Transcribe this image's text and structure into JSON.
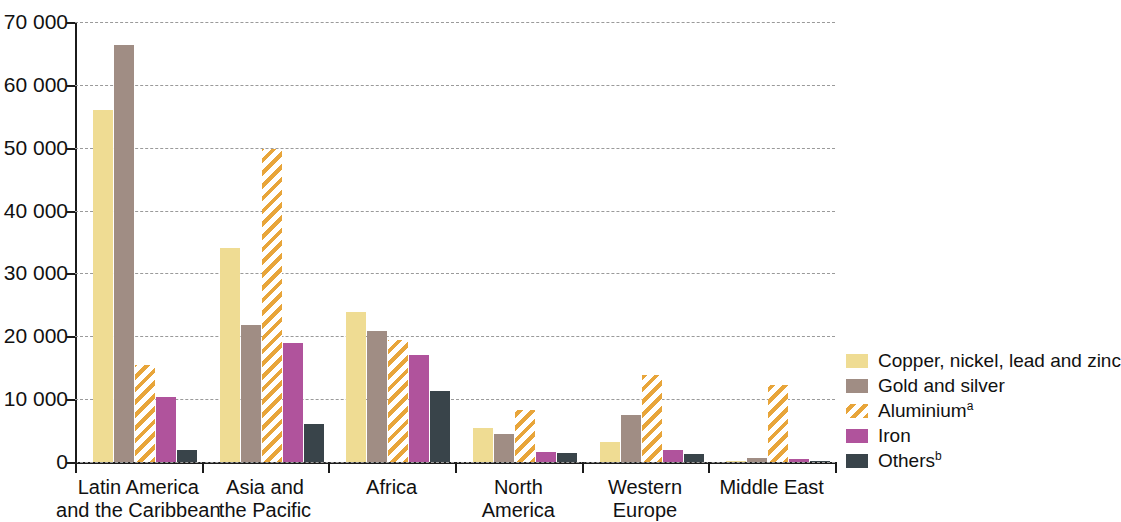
{
  "chart_data": {
    "type": "bar",
    "title": "",
    "subtitle": "",
    "xlabel": "",
    "ylabel": "",
    "ylim": [
      0,
      70000
    ],
    "ytick_labels": [
      "0",
      "10 000",
      "20 000",
      "30 000",
      "40 000",
      "50 000",
      "60 000",
      "70 000"
    ],
    "ytick_values": [
      0,
      10000,
      20000,
      30000,
      40000,
      50000,
      60000,
      70000
    ],
    "grid": true,
    "grid_style": "dashed-horizontal",
    "legend_position": "right",
    "categories": [
      "Latin America\nand the Caribbean",
      "Asia and\nthe Pacific",
      "Africa",
      "North\nAmerica",
      "Western\nEurope",
      "Middle East"
    ],
    "series": [
      {
        "name": "Copper, nickel, lead and zinc",
        "legend_suffix": "",
        "color": "#efdc93",
        "fill": "solid",
        "values": [
          56000,
          34000,
          23900,
          5400,
          3200,
          200
        ]
      },
      {
        "name": "Gold and silver",
        "legend_suffix": "",
        "color": "#a08d84",
        "fill": "solid",
        "values": [
          66300,
          21800,
          20900,
          4400,
          7500,
          700
        ]
      },
      {
        "name": "Aluminium",
        "legend_suffix": "a",
        "color": "#e8a53a",
        "fill": "diagonal-hatch",
        "values": [
          15500,
          49800,
          19400,
          8200,
          13800,
          12200
        ]
      },
      {
        "name": "Iron",
        "legend_suffix": "",
        "color": "#b0539c",
        "fill": "solid",
        "values": [
          10400,
          19000,
          17000,
          1600,
          1900,
          500
        ]
      },
      {
        "name": "Others",
        "legend_suffix": "b",
        "color": "#39444a",
        "fill": "solid",
        "values": [
          1900,
          6000,
          11300,
          1500,
          1200,
          150
        ]
      }
    ]
  }
}
